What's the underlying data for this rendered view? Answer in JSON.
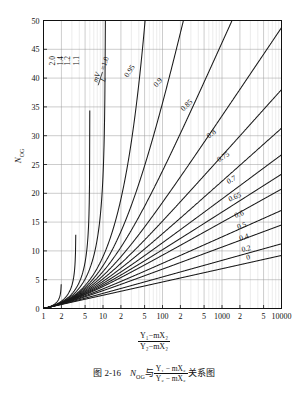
{
  "figure": {
    "caption_prefix": "图 2-16",
    "caption_symbol": "N",
    "caption_symbol_sub": "OG",
    "caption_connector": "与",
    "caption_frac_num": "Y₁ − mX₂",
    "caption_frac_den": "Y₂ − mX₂",
    "caption_suffix": "关系图"
  },
  "axes": {
    "y_title": "N",
    "y_title_sub": "OG",
    "x_title_num": "Y₁−mX₂",
    "x_title_den": "Y₂−mX₂",
    "x_scale": "log",
    "x_min": 1,
    "x_max": 10000,
    "y_min": 0,
    "y_max": 50,
    "y_ticks": [
      0,
      5,
      10,
      15,
      20,
      25,
      30,
      35,
      40,
      45,
      50
    ],
    "x_tick_values": [
      1,
      2,
      5,
      10,
      20,
      50,
      100,
      200,
      500,
      1000,
      2000,
      5000,
      10000
    ],
    "x_tick_labels": [
      "1",
      "2",
      "5",
      "10",
      "2",
      "5",
      "100",
      "2",
      "5",
      "1000",
      "2",
      "5",
      "10000"
    ],
    "grid": "on"
  },
  "chart_data": {
    "type": "line",
    "xlabel": "(Y₁−mX₂)/(Y₂−mX₂)",
    "ylabel": "N_OG",
    "xscale": "log",
    "xlim": [
      1,
      10000
    ],
    "ylim": [
      0,
      50
    ],
    "legend_position": "inline-curve-labels",
    "parameter_name": "mV/L",
    "note": "Colburn absorption design chart. Each curve is N_OG = ln[(1-A)*R + A]/(1-A) with A = mV/L and R = (Y1-mX2)/(Y2-mX2); for A = 1 the line is N_OG = R - 1 (asymptotic family).",
    "series": [
      {
        "name": "2.0",
        "label": "2.0",
        "mVL": 2.0
      },
      {
        "name": "1.4",
        "label": "1.4",
        "mVL": 1.4
      },
      {
        "name": "1.2",
        "label": "1.2",
        "mVL": 1.2
      },
      {
        "name": "1.1",
        "label": "1.1",
        "mVL": 1.1
      },
      {
        "name": "1.0",
        "label": "mV/L = 1.0",
        "mVL": 1.0
      },
      {
        "name": "0.95",
        "label": "0.95",
        "mVL": 0.95
      },
      {
        "name": "0.9",
        "label": "0.9",
        "mVL": 0.9
      },
      {
        "name": "0.85",
        "label": "0.85",
        "mVL": 0.85
      },
      {
        "name": "0.8",
        "label": "0.8",
        "mVL": 0.8
      },
      {
        "name": "0.75",
        "label": "0.75",
        "mVL": 0.75
      },
      {
        "name": "0.7",
        "label": "0.7",
        "mVL": 0.7
      },
      {
        "name": "0.65",
        "label": "0.65",
        "mVL": 0.65
      },
      {
        "name": "0.6",
        "label": "0.6",
        "mVL": 0.6
      },
      {
        "name": "0.5",
        "label": "0.5",
        "mVL": 0.5
      },
      {
        "name": "0.4",
        "label": "0.4",
        "mVL": 0.4
      },
      {
        "name": "0.2",
        "label": "0.2",
        "mVL": 0.2
      },
      {
        "name": "0",
        "label": "0",
        "mVL": 0.0
      }
    ],
    "curve_label_positions": [
      {
        "label": "2.0",
        "x": 1.55,
        "y": 43
      },
      {
        "label": "1.4",
        "x": 2.15,
        "y": 43
      },
      {
        "label": "1.2",
        "x": 2.75,
        "y": 43
      },
      {
        "label": "1.1",
        "x": 4.0,
        "y": 43
      },
      {
        "label": "mV/L = 1.0",
        "x": 8.5,
        "y": 40
      },
      {
        "label": "0.95",
        "x": 30,
        "y": 41
      },
      {
        "label": "0.9",
        "x": 90,
        "y": 39
      },
      {
        "label": "0.85",
        "x": 270,
        "y": 35
      },
      {
        "label": "0.8",
        "x": 700,
        "y": 30
      },
      {
        "label": "0.75",
        "x": 1100,
        "y": 26
      },
      {
        "label": "0.7",
        "x": 1500,
        "y": 22
      },
      {
        "label": "0.65",
        "x": 1700,
        "y": 19
      },
      {
        "label": "0.6",
        "x": 2000,
        "y": 16
      },
      {
        "label": "0.5",
        "x": 2200,
        "y": 14
      },
      {
        "label": "0.4",
        "x": 2400,
        "y": 12
      },
      {
        "label": "0.2",
        "x": 2600,
        "y": 10
      },
      {
        "label": "0",
        "x": 2800,
        "y": 8.5
      }
    ]
  }
}
